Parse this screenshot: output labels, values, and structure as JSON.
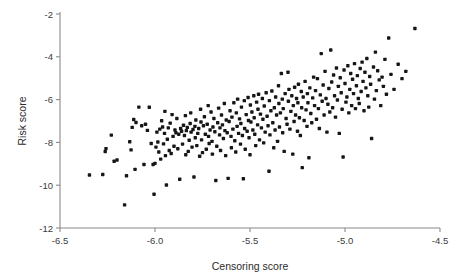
{
  "chart_data": {
    "type": "scatter",
    "title": "",
    "xlabel": "Censoring score",
    "ylabel": "Risk score",
    "xlim": [
      -6.5,
      -4.5
    ],
    "ylim": [
      -12,
      -2
    ],
    "xticks": [
      -6.5,
      -6.0,
      -5.5,
      -5.0,
      -4.5
    ],
    "xticklabels": [
      "-6.5",
      "-6.0",
      "-5.5",
      "-5.0",
      "-4.5"
    ],
    "yticks": [
      -2,
      -4,
      -6,
      -8,
      -10,
      -12
    ],
    "yticklabels": [
      "-2",
      "-4",
      "-6",
      "-8",
      "-10",
      "-12"
    ],
    "grid": false,
    "legend": null,
    "marker": {
      "shape": "square",
      "color": "#161616",
      "size_px": 3.4
    },
    "axes_style": {
      "spines": [
        "left",
        "bottom"
      ],
      "color": "#8a8a8a"
    },
    "n_points": 301,
    "points": [
      [
        -6.345,
        -9.52
      ],
      [
        -6.275,
        -9.5
      ],
      [
        -6.262,
        -8.43
      ],
      [
        -6.258,
        -8.29
      ],
      [
        -6.23,
        -7.66
      ],
      [
        -6.215,
        -8.88
      ],
      [
        -6.2,
        -8.82
      ],
      [
        -6.16,
        -10.92
      ],
      [
        -6.15,
        -9.56
      ],
      [
        -6.133,
        -7.97
      ],
      [
        -6.126,
        -8.35
      ],
      [
        -6.12,
        -7.3
      ],
      [
        -6.112,
        -6.93
      ],
      [
        -6.105,
        -9.26
      ],
      [
        -6.1,
        -7.07
      ],
      [
        -6.085,
        -6.35
      ],
      [
        -6.07,
        -7.22
      ],
      [
        -6.058,
        -9.03
      ],
      [
        -6.05,
        -7.15
      ],
      [
        -6.04,
        -7.44
      ],
      [
        -6.03,
        -6.36
      ],
      [
        -6.02,
        -8.05
      ],
      [
        -6.01,
        -9.03
      ],
      [
        -6.005,
        -10.42
      ],
      [
        -6.0,
        -8.98
      ],
      [
        -5.995,
        -8.22
      ],
      [
        -5.99,
        -7.52
      ],
      [
        -5.985,
        -7.98
      ],
      [
        -5.98,
        -8.45
      ],
      [
        -5.975,
        -7.38
      ],
      [
        -5.97,
        -8.78
      ],
      [
        -5.965,
        -6.99
      ],
      [
        -5.96,
        -7.28
      ],
      [
        -5.955,
        -8.07
      ],
      [
        -5.95,
        -7.58
      ],
      [
        -5.948,
        -6.55
      ],
      [
        -5.945,
        -8.62
      ],
      [
        -5.94,
        -9.99
      ],
      [
        -5.935,
        -7.85
      ],
      [
        -5.93,
        -7.32
      ],
      [
        -5.925,
        -8.38
      ],
      [
        -5.92,
        -7.1
      ],
      [
        -5.915,
        -8.52
      ],
      [
        -5.91,
        -6.7
      ],
      [
        -5.905,
        -7.72
      ],
      [
        -5.9,
        -8.18
      ],
      [
        -5.895,
        -7.42
      ],
      [
        -5.89,
        -7.55
      ],
      [
        -5.885,
        -6.88
      ],
      [
        -5.88,
        -8.3
      ],
      [
        -5.875,
        -7.62
      ],
      [
        -5.87,
        -9.72
      ],
      [
        -5.865,
        -7.35
      ],
      [
        -5.86,
        -7.48
      ],
      [
        -5.855,
        -8.08
      ],
      [
        -5.85,
        -7.2
      ],
      [
        -5.845,
        -7.68
      ],
      [
        -5.84,
        -6.75
      ],
      [
        -5.838,
        -8.58
      ],
      [
        -5.835,
        -7.45
      ],
      [
        -5.83,
        -7.3
      ],
      [
        -5.825,
        -8.42
      ],
      [
        -5.82,
        -7.9
      ],
      [
        -5.815,
        -7.12
      ],
      [
        -5.812,
        -6.62
      ],
      [
        -5.81,
        -7.52
      ],
      [
        -5.805,
        -8.22
      ],
      [
        -5.8,
        -7.4
      ],
      [
        -5.795,
        -9.62
      ],
      [
        -5.79,
        -7.25
      ],
      [
        -5.788,
        -7.78
      ],
      [
        -5.785,
        -6.95
      ],
      [
        -5.78,
        -8.15
      ],
      [
        -5.775,
        -7.58
      ],
      [
        -5.77,
        -7.35
      ],
      [
        -5.765,
        -8.65
      ],
      [
        -5.76,
        -6.45
      ],
      [
        -5.758,
        -7.05
      ],
      [
        -5.755,
        -7.88
      ],
      [
        -5.75,
        -8.48
      ],
      [
        -5.745,
        -7.22
      ],
      [
        -5.74,
        -6.8
      ],
      [
        -5.735,
        -7.62
      ],
      [
        -5.73,
        -8.32
      ],
      [
        -5.725,
        -7.15
      ],
      [
        -5.72,
        -6.28
      ],
      [
        -5.718,
        -7.72
      ],
      [
        -5.715,
        -8.05
      ],
      [
        -5.71,
        -7.42
      ],
      [
        -5.705,
        -6.58
      ],
      [
        -5.7,
        -7.95
      ],
      [
        -5.698,
        -8.55
      ],
      [
        -5.695,
        -7.28
      ],
      [
        -5.69,
        -6.88
      ],
      [
        -5.685,
        -7.5
      ],
      [
        -5.68,
        -9.78
      ],
      [
        -5.675,
        -8.18
      ],
      [
        -5.67,
        -7.08
      ],
      [
        -5.665,
        -6.4
      ],
      [
        -5.66,
        -7.65
      ],
      [
        -5.658,
        -7.32
      ],
      [
        -5.655,
        -8.38
      ],
      [
        -5.65,
        -6.72
      ],
      [
        -5.645,
        -7.18
      ],
      [
        -5.64,
        -7.82
      ],
      [
        -5.635,
        -6.18
      ],
      [
        -5.632,
        -7.45
      ],
      [
        -5.628,
        -8.62
      ],
      [
        -5.625,
        -6.95
      ],
      [
        -5.62,
        -7.55
      ],
      [
        -5.615,
        -9.68
      ],
      [
        -5.61,
        -7.02
      ],
      [
        -5.605,
        -6.52
      ],
      [
        -5.6,
        -7.72
      ],
      [
        -5.598,
        -8.25
      ],
      [
        -5.595,
        -6.82
      ],
      [
        -5.59,
        -7.38
      ],
      [
        -5.585,
        -6.15
      ],
      [
        -5.58,
        -7.92
      ],
      [
        -5.575,
        -8.45
      ],
      [
        -5.572,
        -6.62
      ],
      [
        -5.568,
        -7.25
      ],
      [
        -5.565,
        -5.98
      ],
      [
        -5.56,
        -7.58
      ],
      [
        -5.555,
        -6.9
      ],
      [
        -5.55,
        -8.08
      ],
      [
        -5.548,
        -7.12
      ],
      [
        -5.545,
        -6.35
      ],
      [
        -5.54,
        -7.68
      ],
      [
        -5.535,
        -9.7
      ],
      [
        -5.53,
        -6.05
      ],
      [
        -5.528,
        -7.35
      ],
      [
        -5.525,
        -8.32
      ],
      [
        -5.52,
        -6.7
      ],
      [
        -5.515,
        -7.48
      ],
      [
        -5.51,
        -5.9
      ],
      [
        -5.508,
        -6.98
      ],
      [
        -5.505,
        -7.78
      ],
      [
        -5.5,
        -8.58
      ],
      [
        -5.498,
        -6.25
      ],
      [
        -5.495,
        -7.05
      ],
      [
        -5.49,
        -6.58
      ],
      [
        -5.485,
        -7.42
      ],
      [
        -5.48,
        -5.82
      ],
      [
        -5.478,
        -6.85
      ],
      [
        -5.475,
        -7.62
      ],
      [
        -5.47,
        -8.15
      ],
      [
        -5.465,
        -6.12
      ],
      [
        -5.46,
        -7.18
      ],
      [
        -5.458,
        -6.45
      ],
      [
        -5.455,
        -5.75
      ],
      [
        -5.45,
        -7.88
      ],
      [
        -5.445,
        -6.68
      ],
      [
        -5.44,
        -7.32
      ],
      [
        -5.435,
        -5.95
      ],
      [
        -5.432,
        -6.92
      ],
      [
        -5.428,
        -8.02
      ],
      [
        -5.425,
        -6.3
      ],
      [
        -5.42,
        -7.52
      ],
      [
        -5.415,
        -5.68
      ],
      [
        -5.41,
        -6.78
      ],
      [
        -5.405,
        -7.22
      ],
      [
        -5.4,
        -9.35
      ],
      [
        -5.398,
        -6.05
      ],
      [
        -5.395,
        -7.65
      ],
      [
        -5.39,
        -6.52
      ],
      [
        -5.385,
        -5.6
      ],
      [
        -5.38,
        -7.08
      ],
      [
        -5.375,
        -8.25
      ],
      [
        -5.372,
        -6.38
      ],
      [
        -5.368,
        -7.42
      ],
      [
        -5.365,
        -5.88
      ],
      [
        -5.36,
        -6.72
      ],
      [
        -5.355,
        -7.95
      ],
      [
        -5.35,
        -5.35
      ],
      [
        -5.348,
        -6.18
      ],
      [
        -5.345,
        -7.28
      ],
      [
        -5.34,
        -6.62
      ],
      [
        -5.335,
        -4.78
      ],
      [
        -5.33,
        -5.98
      ],
      [
        -5.328,
        -7.55
      ],
      [
        -5.325,
        -6.42
      ],
      [
        -5.32,
        -8.42
      ],
      [
        -5.315,
        -5.72
      ],
      [
        -5.31,
        -6.88
      ],
      [
        -5.305,
        -7.15
      ],
      [
        -5.3,
        -4.72
      ],
      [
        -5.298,
        -6.08
      ],
      [
        -5.295,
        -5.52
      ],
      [
        -5.29,
        -7.38
      ],
      [
        -5.285,
        -6.55
      ],
      [
        -5.28,
        -5.82
      ],
      [
        -5.275,
        -8.55
      ],
      [
        -5.272,
        -6.28
      ],
      [
        -5.268,
        -7.02
      ],
      [
        -5.265,
        -5.42
      ],
      [
        -5.26,
        -6.72
      ],
      [
        -5.255,
        -5.95
      ],
      [
        -5.25,
        -7.48
      ],
      [
        -5.248,
        -6.15
      ],
      [
        -5.245,
        -5.28
      ],
      [
        -5.24,
        -6.85
      ],
      [
        -5.235,
        -7.68
      ],
      [
        -5.23,
        -5.62
      ],
      [
        -5.228,
        -6.38
      ],
      [
        -5.225,
        -9.18
      ],
      [
        -5.22,
        -5.88
      ],
      [
        -5.215,
        -6.98
      ],
      [
        -5.21,
        -5.15
      ],
      [
        -5.205,
        -6.48
      ],
      [
        -5.2,
        -7.25
      ],
      [
        -5.198,
        -5.72
      ],
      [
        -5.195,
        -6.15
      ],
      [
        -5.19,
        -8.72
      ],
      [
        -5.185,
        -5.45
      ],
      [
        -5.18,
        -6.65
      ],
      [
        -5.175,
        -7.08
      ],
      [
        -5.17,
        -5.92
      ],
      [
        -5.165,
        -4.95
      ],
      [
        -5.16,
        -6.28
      ],
      [
        -5.155,
        -5.58
      ],
      [
        -5.15,
        -6.92
      ],
      [
        -5.145,
        -5.02
      ],
      [
        -5.14,
        -6.42
      ],
      [
        -5.135,
        -7.35
      ],
      [
        -5.13,
        -5.78
      ],
      [
        -5.125,
        -3.85
      ],
      [
        -5.12,
        -6.08
      ],
      [
        -5.115,
        -5.32
      ],
      [
        -5.11,
        -6.72
      ],
      [
        -5.105,
        -4.68
      ],
      [
        -5.1,
        -5.95
      ],
      [
        -5.095,
        -7.52
      ],
      [
        -5.09,
        -6.22
      ],
      [
        -5.085,
        -5.48
      ],
      [
        -5.08,
        -6.58
      ],
      [
        -5.075,
        -3.68
      ],
      [
        -5.07,
        -5.18
      ],
      [
        -5.065,
        -6.38
      ],
      [
        -5.06,
        -4.85
      ],
      [
        -5.055,
        -5.82
      ],
      [
        -5.05,
        -6.82
      ],
      [
        -5.045,
        -4.52
      ],
      [
        -5.04,
        -6.02
      ],
      [
        -5.035,
        -5.38
      ],
      [
        -5.03,
        -7.58
      ],
      [
        -5.025,
        -4.98
      ],
      [
        -5.02,
        -5.68
      ],
      [
        -5.015,
        -6.45
      ],
      [
        -5.01,
        -8.68
      ],
      [
        -5.005,
        -4.62
      ],
      [
        -5.0,
        -5.25
      ],
      [
        -4.995,
        -6.12
      ],
      [
        -4.99,
        -5.88
      ],
      [
        -4.985,
        -4.42
      ],
      [
        -4.98,
        -6.62
      ],
      [
        -4.975,
        -5.52
      ],
      [
        -4.97,
        -4.78
      ],
      [
        -4.965,
        -6.28
      ],
      [
        -4.96,
        -5.05
      ],
      [
        -4.955,
        -5.72
      ],
      [
        -4.95,
        -4.32
      ],
      [
        -4.945,
        -6.42
      ],
      [
        -4.94,
        -5.35
      ],
      [
        -4.935,
        -4.88
      ],
      [
        -4.93,
        -5.95
      ],
      [
        -4.925,
        -6.18
      ],
      [
        -4.92,
        -4.55
      ],
      [
        -4.915,
        -5.62
      ],
      [
        -4.91,
        -4.25
      ],
      [
        -4.905,
        -5.15
      ],
      [
        -4.9,
        -6.52
      ],
      [
        -4.895,
        -4.72
      ],
      [
        -4.89,
        -5.45
      ],
      [
        -4.885,
        -4.08
      ],
      [
        -4.88,
        -5.82
      ],
      [
        -4.875,
        -6.35
      ],
      [
        -4.87,
        -4.92
      ],
      [
        -4.865,
        -5.28
      ],
      [
        -4.86,
        -7.82
      ],
      [
        -4.85,
        -4.48
      ],
      [
        -4.845,
        -5.98
      ],
      [
        -4.84,
        -3.78
      ],
      [
        -4.835,
        -5.58
      ],
      [
        -4.828,
        -4.65
      ],
      [
        -4.82,
        -5.08
      ],
      [
        -4.812,
        -6.28
      ],
      [
        -4.805,
        -4.95
      ],
      [
        -4.798,
        -5.38
      ],
      [
        -4.79,
        -4.12
      ],
      [
        -4.782,
        -5.75
      ],
      [
        -4.77,
        -3.12
      ],
      [
        -4.758,
        -4.82
      ],
      [
        -4.742,
        -5.52
      ],
      [
        -4.72,
        -4.35
      ],
      [
        -4.7,
        -5.02
      ],
      [
        -4.68,
        -4.68
      ],
      [
        -4.632,
        -2.68
      ]
    ]
  }
}
